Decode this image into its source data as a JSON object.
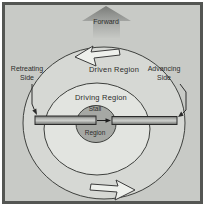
{
  "figure": {
    "forward_label": "Forward",
    "regions": {
      "driven": "Driven Region",
      "driving": "Driving Region",
      "stall_line1": "Stall",
      "stall_line2": "Region"
    },
    "sides": {
      "retreating_line1": "Retreating",
      "retreating_line2": "Side",
      "advancing_line1": "Advancing",
      "advancing_line2": "Side"
    },
    "colors": {
      "page_margin": "#ffffff",
      "frame_border": "#545653",
      "background": "#c8cac6",
      "driven_region_fill": "#d6d8d4",
      "driving_region_fill": "#e2e4e0",
      "stall_region_fill": "#a6a8a4",
      "outline": "#3e403d",
      "text": "#2d2d2b",
      "rotation_arrow_fill": "#eef0ec",
      "blade_edge": "#2b2b2b"
    }
  }
}
